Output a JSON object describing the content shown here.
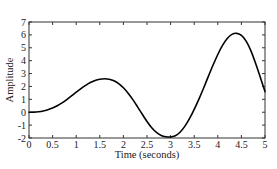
{
  "chart_data": {
    "type": "line",
    "title": "",
    "xlabel": "Time (seconds)",
    "ylabel": "Amplitude",
    "xlim": [
      0,
      5
    ],
    "ylim": [
      -2,
      7
    ],
    "grid": false,
    "legend": null,
    "x_ticks": [
      0,
      0.5,
      1,
      1.5,
      2,
      2.5,
      3,
      3.5,
      4,
      4.5,
      5
    ],
    "x_tick_labels": [
      "0",
      "0.5",
      "1",
      "1.5",
      "2",
      "2.5",
      "3",
      "3.5",
      "4",
      "4.5",
      "5"
    ],
    "y_ticks": [
      -2,
      -1,
      0,
      1,
      2,
      3,
      4,
      5,
      6,
      7
    ],
    "y_tick_labels": [
      "-2",
      "-1",
      "0",
      "1",
      "2",
      "3",
      "4",
      "5",
      "6",
      "7"
    ],
    "series": [
      {
        "name": "signal",
        "color": "#000000",
        "x": [
          0,
          0.1,
          0.2,
          0.3,
          0.4,
          0.5,
          0.6,
          0.7,
          0.8,
          0.9,
          1.0,
          1.1,
          1.2,
          1.3,
          1.4,
          1.5,
          1.6,
          1.7,
          1.8,
          1.9,
          2.0,
          2.1,
          2.2,
          2.3,
          2.4,
          2.5,
          2.6,
          2.7,
          2.8,
          2.9,
          3.0,
          3.1,
          3.2,
          3.3,
          3.4,
          3.5,
          3.6,
          3.7,
          3.8,
          3.9,
          4.0,
          4.1,
          4.2,
          4.3,
          4.4,
          4.5,
          4.6,
          4.7,
          4.8,
          4.9,
          5.0
        ],
        "y": [
          0.0,
          0.01,
          0.04,
          0.1,
          0.2,
          0.33,
          0.5,
          0.72,
          0.98,
          1.26,
          1.55,
          1.83,
          2.08,
          2.3,
          2.46,
          2.56,
          2.6,
          2.56,
          2.44,
          2.22,
          1.9,
          1.48,
          0.98,
          0.42,
          -0.16,
          -0.72,
          -1.2,
          -1.56,
          -1.8,
          -1.9,
          -1.92,
          -1.82,
          -1.55,
          -1.1,
          -0.5,
          0.22,
          1.02,
          1.88,
          2.78,
          3.66,
          4.48,
          5.18,
          5.72,
          6.04,
          6.12,
          5.96,
          5.52,
          4.78,
          3.8,
          2.72,
          1.6
        ]
      }
    ]
  }
}
